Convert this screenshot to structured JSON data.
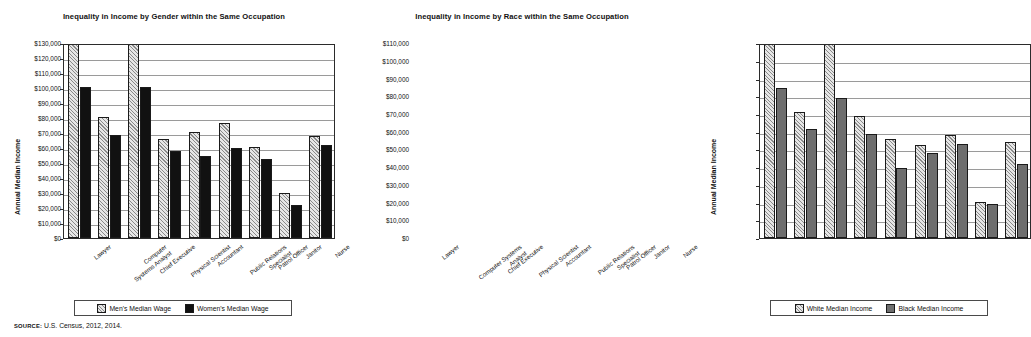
{
  "source_note": {
    "label": "SOURCE:",
    "text": "U.S. Census, 2012, 2014."
  },
  "chart_data": [
    {
      "type": "bar",
      "title": "Inequality in Income by Gender within the Same Occupation",
      "xlabel": "",
      "ylabel": "Annual Median Income",
      "ylim": [
        0,
        130000
      ],
      "ytick_step": 10000,
      "grid": true,
      "legend_position": "bottom",
      "tick_labels": [
        "$0",
        "$10,000",
        "$20,000",
        "$30,000",
        "$40,000",
        "$50,000",
        "$60,000",
        "$70,000",
        "$80,000",
        "$90,000",
        "$100,000",
        "$110,000",
        "$120,000",
        "$130,000"
      ],
      "categories": [
        "Lawyer",
        "Computer Systems Analyst",
        "Chief Executive",
        "Physical Scientist",
        "Accountant",
        "Public Relations Specialist",
        "Patrol Officer",
        "Janitor",
        "Nurse"
      ],
      "category_lines": [
        [
          "Lawyer"
        ],
        [
          "Computer",
          "Systems Analyst"
        ],
        [
          "Chief Executive"
        ],
        [
          "Physical Scientist"
        ],
        [
          "Accountant"
        ],
        [
          "Public Relations",
          "Specialist"
        ],
        [
          "Patrol Officer"
        ],
        [
          "Janitor"
        ],
        [
          "Nurse"
        ]
      ],
      "series": [
        {
          "name": "Men's Median Wage",
          "fill": "hatch",
          "values": [
            130000,
            81000,
            130000,
            66000,
            71000,
            77000,
            61000,
            30000,
            68000
          ]
        },
        {
          "name": "Women's Median Wage",
          "fill": "solid-black",
          "values": [
            101000,
            69000,
            101000,
            58000,
            54500,
            60000,
            53000,
            22000,
            62000
          ]
        }
      ]
    },
    {
      "type": "bar",
      "title": "Inequality in Income by Race within the Same Occupation",
      "xlabel": "",
      "ylabel": "Annual Median Income",
      "ylim": [
        0,
        110000
      ],
      "ytick_step": 10000,
      "grid": true,
      "legend_position": "bottom",
      "tick_labels": [
        "$0",
        "$10,000",
        "$20,000",
        "$30,000",
        "$40,000",
        "$50,000",
        "$60,000",
        "$70,000",
        "$80,000",
        "$90,000",
        "$100,000",
        "$110,000"
      ],
      "categories": [
        "Lawyer",
        "Computer Systems Analyst",
        "Chief Executive",
        "Physical Scientist",
        "Accountant",
        "Public Relations Specialist",
        "Patrol Officer",
        "Janitor",
        "Nurse"
      ],
      "category_lines": [
        [
          "Lawyer"
        ],
        [
          "Computer Systems",
          "Analyst"
        ],
        [
          "Chief Executive"
        ],
        [
          "Physical Scientist"
        ],
        [
          "Accountant"
        ],
        [
          "Public Relations",
          "Specialist"
        ],
        [
          "Patrol Officer"
        ],
        [
          "Janitor"
        ],
        [
          "Nurse"
        ]
      ],
      "series": [
        {
          "name": "White Median Income",
          "fill": "hatch",
          "values": [
            110000,
            71000,
            111000,
            69000,
            56000,
            52500,
            58000,
            20500,
            54000
          ]
        },
        {
          "name": "Black Median Income",
          "fill": "solid-gray",
          "values": [
            84500,
            61500,
            79000,
            58500,
            39500,
            48000,
            53000,
            19000,
            42000
          ]
        }
      ]
    }
  ]
}
